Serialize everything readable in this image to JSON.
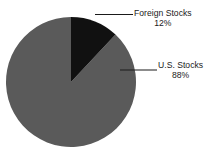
{
  "chart_data": {
    "type": "pie",
    "title": "",
    "subtitle": "",
    "xlabel": "",
    "ylabel": "",
    "grid": false,
    "legend_position": "none",
    "labels_position": "outside-right-with-leader-lines",
    "start_angle_deg": 0,
    "direction": "clockwise",
    "categories": [
      "Foreign Stocks",
      "U.S. Stocks"
    ],
    "values": [
      12,
      88
    ],
    "value_unit": "%",
    "slices": [
      {
        "name": "Foreign Stocks",
        "value": 12,
        "label": "Foreign Stocks",
        "value_label": "12%",
        "color": "#111111",
        "start_angle_deg": 0,
        "end_angle_deg": 43.2
      },
      {
        "name": "U.S. Stocks",
        "value": 88,
        "label": "U.S. Stocks",
        "value_label": "88%",
        "color": "#5a5a5a",
        "start_angle_deg": 43.2,
        "end_angle_deg": 360
      }
    ]
  },
  "colors": {
    "background": "#ffffff",
    "foreign_slice": "#111111",
    "domestic_slice": "#5a5a5a",
    "leader_line": "#1a1a1a",
    "text": "#1a1a1a"
  },
  "geometry": {
    "center_x": 71,
    "center_y": 82,
    "radius": 65
  },
  "labels": {
    "foreign": {
      "name": "Foreign Stocks",
      "value": "12%"
    },
    "domestic": {
      "name": "U.S. Stocks",
      "value": "88%"
    }
  }
}
